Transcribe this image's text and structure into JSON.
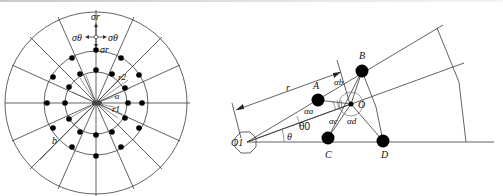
{
  "figure_left": {
    "title": "Radial node layout around a central hole",
    "labels": {
      "sigma_r_top": "σr",
      "sigma_theta_left": "σθ",
      "sigma_theta_right": "σθ",
      "sigma_r_inner": "σr",
      "r2": "r2",
      "a": "a",
      "r1": "r1",
      "b": "b"
    },
    "spoke_count": 16,
    "node_rings": 3
  },
  "figure_right": {
    "title": "Eccentric node geometry",
    "labels": {
      "O1": "O1",
      "O": "O",
      "A": "A",
      "B": "B",
      "C": "C",
      "D": "D",
      "r": "r",
      "theta": "θ",
      "theta0": "θ0",
      "alpha_a": "αa",
      "alpha_b": "αb",
      "alpha_c": "αc",
      "alpha_d": "αd"
    }
  }
}
